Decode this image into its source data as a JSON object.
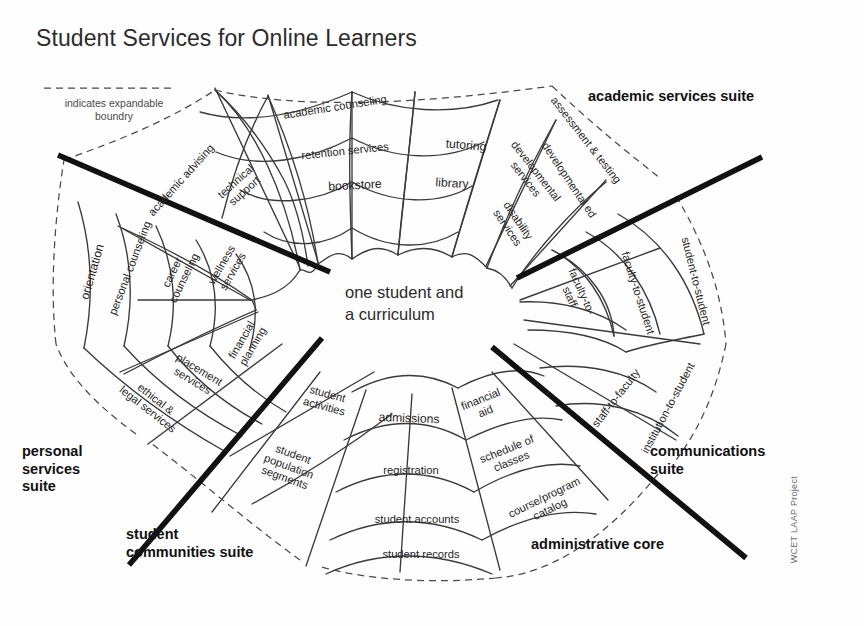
{
  "title": "Student Services for Online Learners",
  "legend": {
    "text": "indicates expandable\nboundry",
    "dash_color": "#555555"
  },
  "center": {
    "text": "one student and\na curriculum"
  },
  "credit": "WCET LAAP Project",
  "colors": {
    "background": "#fefefe",
    "web_line": "#3a3a3a",
    "divider": "#111111",
    "boundary_dash": "#4a4a4a",
    "text": "#262626",
    "title": "#2b2b2b"
  },
  "suites": [
    {
      "id": "academic",
      "label": "academic services suite"
    },
    {
      "id": "communications",
      "label": "communications\nsuite"
    },
    {
      "id": "administrative",
      "label": "administrative core"
    },
    {
      "id": "student",
      "label": "student\ncommunities suite"
    },
    {
      "id": "personal",
      "label": "personal\nservices\nsuite"
    }
  ],
  "cells": [
    {
      "id": "orientation",
      "suite": "personal",
      "label": "orientation",
      "x": 93,
      "y": 272,
      "rot": -74
    },
    {
      "id": "personal-counseling",
      "suite": "personal",
      "label": "personal counseling",
      "x": 130,
      "y": 268,
      "rot": -69
    },
    {
      "id": "career-counseling",
      "suite": "personal",
      "label": "career\ncounseling",
      "x": 178,
      "y": 275,
      "rot": -64
    },
    {
      "id": "wellness-services",
      "suite": "personal",
      "label": "wellness\nservices",
      "x": 227,
      "y": 268,
      "rot": -60
    },
    {
      "id": "ethical-legal-services",
      "suite": "personal",
      "label": "ethical &\nlegal services",
      "x": 152,
      "y": 404,
      "rot": 38
    },
    {
      "id": "placement-services",
      "suite": "personal",
      "label": "placement\nservices",
      "x": 196,
      "y": 375,
      "rot": 31
    },
    {
      "id": "financial-planning",
      "suite": "personal",
      "label": "financial\nplanning",
      "x": 247,
      "y": 343,
      "rot": -60
    },
    {
      "id": "academic-advising",
      "suite": "academic",
      "label": "academic advising",
      "x": 181,
      "y": 180,
      "rot": -48
    },
    {
      "id": "technical-support",
      "suite": "academic",
      "label": "technical\nsupport",
      "x": 240,
      "y": 186,
      "rot": -42
    },
    {
      "id": "academic-counseling",
      "suite": "academic",
      "label": "academic counseling",
      "x": 335,
      "y": 107,
      "rot": -9
    },
    {
      "id": "retention-services",
      "suite": "academic",
      "label": "retention services",
      "x": 345,
      "y": 151,
      "rot": -6
    },
    {
      "id": "bookstore",
      "suite": "academic",
      "label": "bookstore",
      "x": 355,
      "y": 186,
      "rot": -3
    },
    {
      "id": "tutoring",
      "suite": "academic",
      "label": "tutoring",
      "x": 466,
      "y": 146,
      "rot": 5
    },
    {
      "id": "library",
      "suite": "academic",
      "label": "library",
      "x": 452,
      "y": 184,
      "rot": 3
    },
    {
      "id": "developmental-services",
      "suite": "academic",
      "label": "developmental\nservices",
      "x": 531,
      "y": 175,
      "rot": 52
    },
    {
      "id": "disability-services",
      "suite": "academic",
      "label": "disability\nservices",
      "x": 513,
      "y": 224,
      "rot": 56
    },
    {
      "id": "assessment-testing",
      "suite": "academic",
      "label": "assessment & testing",
      "x": 586,
      "y": 140,
      "rot": 52
    },
    {
      "id": "developmental-ed",
      "suite": "academic",
      "label": "developmental ed",
      "x": 569,
      "y": 180,
      "rot": 56
    },
    {
      "id": "faculty-to-staff",
      "suite": "communications",
      "label": "faculty-to-\nstaff",
      "x": 576,
      "y": 294,
      "rot": 66
    },
    {
      "id": "faculty-to-student",
      "suite": "communications",
      "label": "faculty-to-student",
      "x": 638,
      "y": 293,
      "rot": 72
    },
    {
      "id": "student-to-student",
      "suite": "communications",
      "label": "student-to-student",
      "x": 696,
      "y": 281,
      "rot": 76
    },
    {
      "id": "staff-to-faculty",
      "suite": "communications",
      "label": "staff-to-faculty",
      "x": 616,
      "y": 398,
      "rot": -52
    },
    {
      "id": "institution-to-student",
      "suite": "communications",
      "label": "institution-to-student",
      "x": 668,
      "y": 408,
      "rot": -62
    },
    {
      "id": "student-activities",
      "suite": "student",
      "label": "student\nactivities",
      "x": 326,
      "y": 400,
      "rot": 15
    },
    {
      "id": "student-population-segments",
      "suite": "student",
      "label": "student\npopulation\nsegments",
      "x": 289,
      "y": 466,
      "rot": 20
    },
    {
      "id": "admissions",
      "suite": "administrative",
      "label": "admissions",
      "x": 409,
      "y": 419,
      "rot": 2
    },
    {
      "id": "registration",
      "suite": "administrative",
      "label": "registration",
      "x": 411,
      "y": 470,
      "rot": 0
    },
    {
      "id": "student-accounts",
      "suite": "administrative",
      "label": "student accounts",
      "x": 417,
      "y": 519,
      "rot": 0
    },
    {
      "id": "student-records",
      "suite": "administrative",
      "label": "student records",
      "x": 421,
      "y": 554,
      "rot": 0
    },
    {
      "id": "financial-aid",
      "suite": "administrative",
      "label": "financial\naid",
      "x": 483,
      "y": 405,
      "rot": -22
    },
    {
      "id": "schedule-of-classes",
      "suite": "administrative",
      "label": "schedule of\nclasses",
      "x": 509,
      "y": 455,
      "rot": -22
    },
    {
      "id": "course-program-catalog",
      "suite": "administrative",
      "label": "course/program\ncatalog",
      "x": 547,
      "y": 503,
      "rot": -26
    }
  ]
}
